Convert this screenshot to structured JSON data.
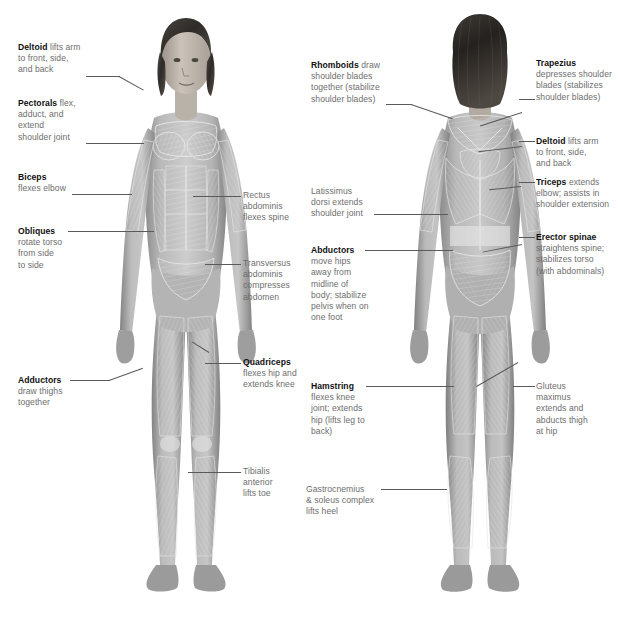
{
  "diagram": {
    "figures": [
      {
        "name": "front-figure",
        "view": "anterior"
      },
      {
        "name": "back-figure",
        "view": "posterior"
      }
    ],
    "colors": {
      "text_bold": "#111111",
      "text_body": "#6e6e6e",
      "leader_line": "#5a5a5a",
      "background": "#ffffff",
      "skin_light": "#cfcfcf",
      "skin_mid": "#a8a8a8",
      "skin_dark": "#7d7d7d",
      "hair": "#3c3a38",
      "muscle_overlay": "#e9e9e9"
    }
  },
  "labels": {
    "front_left": [
      {
        "id": "deltoid-front",
        "bold": "Deltoid",
        "text": "Deltoid lifts arm\nto front, side,\nand back"
      },
      {
        "id": "pectorals",
        "bold": "Pectorals",
        "text": "Pectorals flex,\nadduct, and\nextend\nshoulder joint"
      },
      {
        "id": "biceps",
        "bold": "Biceps",
        "text": "Biceps\nflexes elbow"
      },
      {
        "id": "obliques",
        "bold": "Obliques",
        "text": "Obliques\nrotate torso\nfrom side\nto side"
      },
      {
        "id": "adductors",
        "bold": "Adductors",
        "text": "Adductors\ndraw thighs\ntogether"
      }
    ],
    "front_right": [
      {
        "id": "rectus-abdominis",
        "bold": "Rectus abdominis",
        "text": "Rectus\nabdominis\nflexes spine"
      },
      {
        "id": "transversus-abdominis",
        "bold": "Transversus abdominis",
        "text": "Transversus\nabdominis\ncompresses\nabdomen"
      },
      {
        "id": "quadriceps",
        "bold": "Quadriceps",
        "text": "Quadriceps\nflexes hip and\nextends knee"
      },
      {
        "id": "tibialis-anterior",
        "bold": "Tibialis anterior",
        "text": "Tibialis\nanterior\nlifts toe"
      }
    ],
    "back_left": [
      {
        "id": "rhomboids",
        "bold": "Rhomboids",
        "text": "Rhomboids draw\nshoulder blades\ntogether (stabilize\nshoulder blades)"
      },
      {
        "id": "latissimus-dorsi",
        "bold": "Latissimus dorsi",
        "text": "Latissimus\ndorsi extends\nshoulder joint"
      },
      {
        "id": "abductors",
        "bold": "Abductors",
        "text": "Abductors\nmove hips\naway from\nmidline of\nbody; stabilize\npelvis when on\none foot"
      },
      {
        "id": "hamstring",
        "bold": "Hamstring",
        "text": "Hamstring\nflexes knee\njoint; extends\nhip (lifts leg to\nback)"
      },
      {
        "id": "gastrocnemius-soleus",
        "bold": "Gastrocnemius & soleus complex",
        "text": "Gastrocnemius\n& soleus complex\nlifts heel"
      }
    ],
    "back_right": [
      {
        "id": "trapezius",
        "bold": "Trapezius",
        "text": "Trapezius\ndepresses shoulder\nblades (stabilizes\nshoulder blades)"
      },
      {
        "id": "deltoid-back",
        "bold": "Deltoid",
        "text": "Deltoid lifts arm\nto front, side,\nand back"
      },
      {
        "id": "triceps",
        "bold": "Triceps",
        "text": "Triceps extends\nelbow; assists in\nshoulder extension"
      },
      {
        "id": "erector-spinae",
        "bold": "Erector spinae",
        "text": "Erector spinae\nstraightens spine;\nstabilizes torso\n(with abdominals)"
      },
      {
        "id": "gluteus-maximus",
        "bold": "Gluteus maximus",
        "text": "Gluteus\nmaximus\nextends and\nabducts thigh\nat hip"
      }
    ]
  }
}
